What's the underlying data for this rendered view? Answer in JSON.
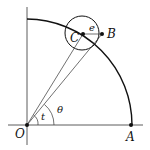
{
  "diagram": {
    "labels": {
      "O": "O",
      "A": "A",
      "B": "B",
      "C": "C",
      "e": "e",
      "t": "t",
      "theta": "θ"
    },
    "colors": {
      "stroke": "#111111",
      "background": "#ffffff"
    }
  }
}
